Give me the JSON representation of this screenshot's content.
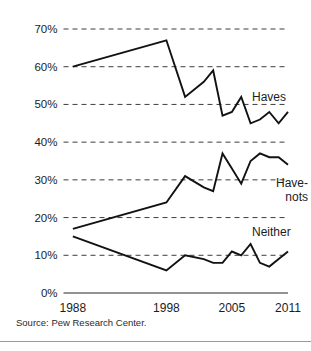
{
  "figure": {
    "background": "#ffffff",
    "line_color": "#121212",
    "grid_color": "#3d3d3d",
    "axis_color": "#6e6e6e"
  },
  "source": {
    "text": "Source: Pew Research Center."
  },
  "chart_data": {
    "type": "line",
    "title": "",
    "subtitle": "",
    "xlabel": "",
    "ylabel": "",
    "grid": true,
    "grid_style": "dashed-horizontal",
    "legend": "inline-right-labels",
    "xlim": [
      1987,
      2011
    ],
    "ylim": [
      0,
      70
    ],
    "yticks": [
      0,
      10,
      20,
      30,
      40,
      50,
      60,
      70
    ],
    "ytick_labels": [
      "0%",
      "10%",
      "20%",
      "30%",
      "40%",
      "50%",
      "60%",
      "70%"
    ],
    "xticks": [
      1988,
      1998,
      2005,
      2011
    ],
    "xtick_labels": [
      "1988",
      "1998",
      "2005",
      "2011"
    ],
    "value_unit": "percent",
    "series": [
      {
        "name": "Haves",
        "label": "Haves",
        "label_lines": [
          "Haves"
        ],
        "x": [
          1988,
          1998,
          2000,
          2002,
          2003,
          2004,
          2005,
          2006,
          2007,
          2008,
          2009,
          2010,
          2011
        ],
        "values": [
          60,
          67,
          52,
          56,
          59,
          47,
          48,
          52,
          45,
          46,
          48,
          45,
          48
        ]
      },
      {
        "name": "Have-nots",
        "label": "Have-nots",
        "label_lines": [
          "Have-",
          "nots"
        ],
        "x": [
          1988,
          1998,
          2000,
          2002,
          2003,
          2004,
          2005,
          2006,
          2007,
          2008,
          2009,
          2010,
          2011
        ],
        "values": [
          17,
          24,
          31,
          28,
          27,
          37,
          33,
          29,
          35,
          37,
          36,
          36,
          34
        ]
      },
      {
        "name": "Neither",
        "label": "Neither",
        "label_lines": [
          "Neither"
        ],
        "x": [
          1988,
          1998,
          2000,
          2002,
          2003,
          2004,
          2005,
          2006,
          2007,
          2008,
          2009,
          2010,
          2011
        ],
        "values": [
          15,
          6,
          10,
          9,
          8,
          8,
          11,
          10,
          13,
          8,
          7,
          9,
          11
        ]
      }
    ]
  }
}
